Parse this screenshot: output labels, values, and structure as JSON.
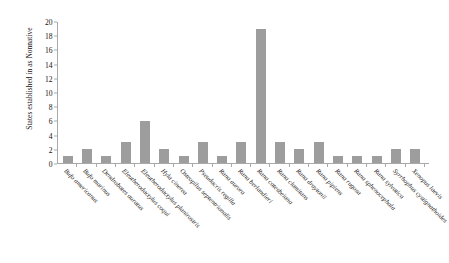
{
  "chart_data": {
    "type": "bar",
    "title": "",
    "xlabel": "",
    "ylabel": "States established in as Nonnative",
    "ylim": [
      0,
      20
    ],
    "ytick_step": 2,
    "ytick_labels": [
      "20",
      "18",
      "16",
      "14",
      "12",
      "10",
      "8",
      "6",
      "4",
      "2",
      "0"
    ],
    "grid": false,
    "legend": false,
    "bar_color": "#9d9d9d",
    "axis_color": "#a9a9a9",
    "categories": [
      "Bufo americanus",
      "Bufo marinus",
      "Dendrobates auratus",
      "Eleutherodactylus coqui",
      "Eleutherodactylus planirostris",
      "Hyla cinerea",
      "Osteopilus septentrionalis",
      "Pseudacris regilla",
      "Rana aurora",
      "Rana berlandieri",
      "Rana catesbeiana",
      "Rana clamitans",
      "Rana draytonii",
      "Rana pipiens",
      "Rana rugosa",
      "Rana sphenocephala",
      "Rana sylvatica",
      "Syrrhophus cystignathoides",
      "Xenopus laevis"
    ],
    "values": [
      1,
      2,
      1,
      3,
      6,
      2,
      1,
      3,
      1,
      3,
      19,
      3,
      2,
      3,
      1,
      1,
      1,
      2,
      2
    ]
  }
}
